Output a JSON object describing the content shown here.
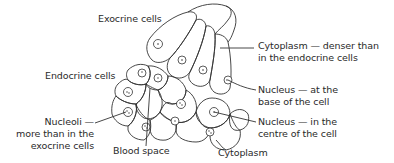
{
  "diagram": {
    "labels": {
      "exocrine_cells": "Exocrine cells",
      "endocrine_cells": "Endocrine cells",
      "cytoplasm_denser_line1": "Cytoplasm — denser than",
      "cytoplasm_denser_line2": "in the endocrine cells",
      "nucleus_base_line1": "Nucleus — at the",
      "nucleus_base_line2": "base of the cell",
      "nucleus_centre_line1": "Nucleus — in the",
      "nucleus_centre_line2": "centre of the cell",
      "nucleoli_line1": "Nucleoli —",
      "nucleoli_line2": "more than in the",
      "nucleoli_line3": "exocrine cells",
      "blood_space": "Blood space",
      "cytoplasm": "Cytoplasm"
    },
    "colors": {
      "stroke": "#333333",
      "text": "#2a2a2a",
      "background": "#ffffff"
    }
  }
}
